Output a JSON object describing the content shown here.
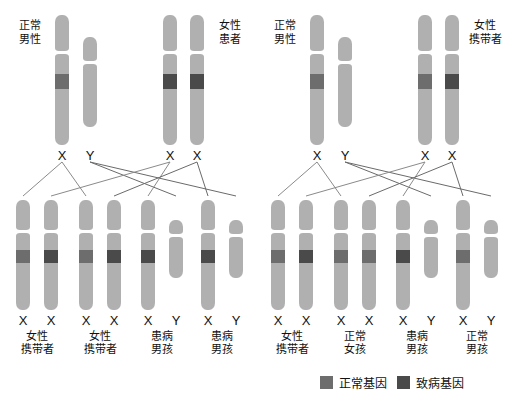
{
  "legend": {
    "items": [
      {
        "label": "正常基因",
        "color": "#6d6d6d",
        "key": "normal"
      },
      {
        "label": "致病基因",
        "color": "#4a4a4a",
        "key": "disease"
      }
    ]
  },
  "panels": [
    {
      "id": "left",
      "parents": [
        {
          "label": "正常男性",
          "label_lines": [
            "正常",
            "男性"
          ],
          "chromosomes": [
            {
              "type": "X",
              "band": "normal",
              "symbol": "X"
            },
            {
              "type": "Y",
              "band": "none",
              "symbol": "Y"
            }
          ]
        },
        {
          "label": "女性患者",
          "label_lines": [
            "女性",
            "患者"
          ],
          "chromosomes": [
            {
              "type": "X",
              "band": "disease",
              "symbol": "X"
            },
            {
              "type": "X",
              "band": "disease",
              "symbol": "X"
            }
          ]
        }
      ],
      "children": [
        {
          "label": "女性携带者",
          "label_lines": [
            "女性",
            "携带者"
          ],
          "chromosomes": [
            {
              "type": "X",
              "band": "normal",
              "symbol": "X"
            },
            {
              "type": "X",
              "band": "disease",
              "symbol": "X"
            }
          ]
        },
        {
          "label": "女性携带者",
          "label_lines": [
            "女性",
            "携带者"
          ],
          "chromosomes": [
            {
              "type": "X",
              "band": "normal",
              "symbol": "X"
            },
            {
              "type": "X",
              "band": "disease",
              "symbol": "X"
            }
          ]
        },
        {
          "label": "患病男孩",
          "label_lines": [
            "患病",
            "男孩"
          ],
          "chromosomes": [
            {
              "type": "X",
              "band": "disease",
              "symbol": "X"
            },
            {
              "type": "Y",
              "band": "none",
              "symbol": "Y"
            }
          ]
        },
        {
          "label": "患病男孩",
          "label_lines": [
            "患病",
            "男孩"
          ],
          "chromosomes": [
            {
              "type": "X",
              "band": "disease",
              "symbol": "X"
            },
            {
              "type": "Y",
              "band": "none",
              "symbol": "Y"
            }
          ]
        }
      ]
    },
    {
      "id": "right",
      "parents": [
        {
          "label": "正常男性",
          "label_lines": [
            "正常",
            "男性"
          ],
          "chromosomes": [
            {
              "type": "X",
              "band": "normal",
              "symbol": "X"
            },
            {
              "type": "Y",
              "band": "none",
              "symbol": "Y"
            }
          ]
        },
        {
          "label": "女性携带者",
          "label_lines": [
            "女性",
            "携带者"
          ],
          "chromosomes": [
            {
              "type": "X",
              "band": "normal",
              "symbol": "X"
            },
            {
              "type": "X",
              "band": "disease",
              "symbol": "X"
            }
          ]
        }
      ],
      "children": [
        {
          "label": "女性携带者",
          "label_lines": [
            "女性",
            "携带者"
          ],
          "chromosomes": [
            {
              "type": "X",
              "band": "normal",
              "symbol": "X"
            },
            {
              "type": "X",
              "band": "disease",
              "symbol": "X"
            }
          ]
        },
        {
          "label": "正常女孩",
          "label_lines": [
            "正常",
            "女孩"
          ],
          "chromosomes": [
            {
              "type": "X",
              "band": "normal",
              "symbol": "X"
            },
            {
              "type": "X",
              "band": "normal",
              "symbol": "X"
            }
          ]
        },
        {
          "label": "患病男孩",
          "label_lines": [
            "患病",
            "男孩"
          ],
          "chromosomes": [
            {
              "type": "X",
              "band": "disease",
              "symbol": "X"
            },
            {
              "type": "Y",
              "band": "none",
              "symbol": "Y"
            }
          ]
        },
        {
          "label": "正常男孩",
          "label_lines": [
            "正常",
            "男孩"
          ],
          "chromosomes": [
            {
              "type": "X",
              "band": "normal",
              "symbol": "X"
            },
            {
              "type": "Y",
              "band": "none",
              "symbol": "Y"
            }
          ]
        }
      ]
    }
  ]
}
